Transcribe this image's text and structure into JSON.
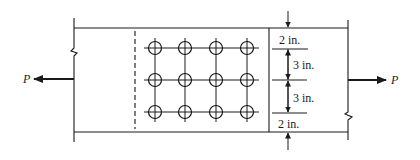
{
  "diagram": {
    "type": "bolted lap splice connection",
    "load_label_left": "P",
    "load_label_right": "P",
    "bolt_grid": {
      "rows": 3,
      "columns": 4
    },
    "dimensions": {
      "top_edge": "2 in.",
      "spacing_1": "3 in.",
      "spacing_2": "3 in.",
      "bottom_edge": "2 in."
    }
  }
}
